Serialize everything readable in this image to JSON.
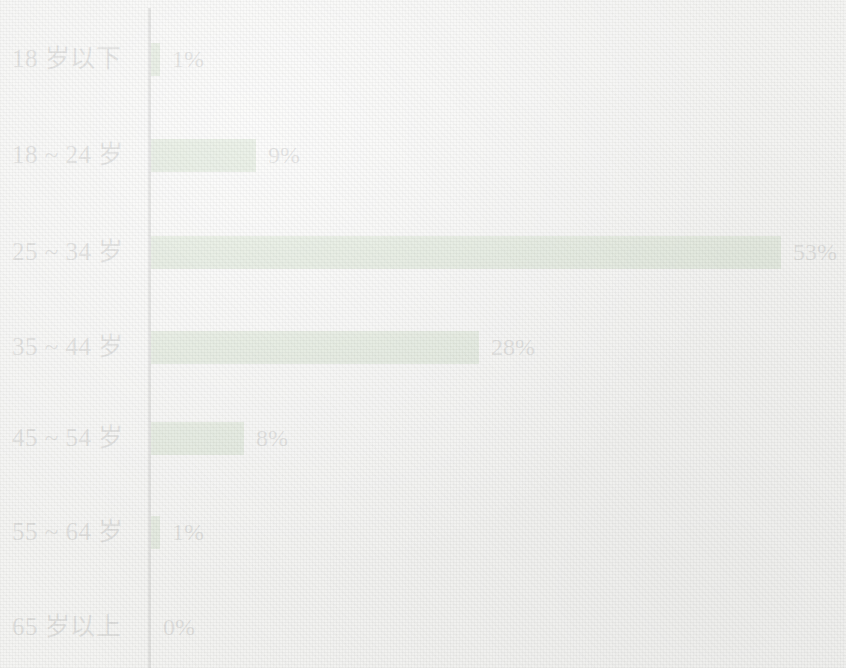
{
  "chart_data": {
    "type": "bar",
    "orientation": "horizontal",
    "title": "",
    "subtitle": "",
    "xlabel": "",
    "ylabel": "",
    "xlim": [
      0,
      53
    ],
    "ylim": null,
    "grid": false,
    "legend": null,
    "value_suffix": "%",
    "series_color": "#4e8a35",
    "axis_color": "#141414",
    "background_color": "#f3f3f1",
    "categories": [
      "18 岁以下",
      "18 ~ 24 岁",
      "25 ~ 34 岁",
      "35 ~ 44 岁",
      "45 ~ 54 岁",
      "55 ~ 64 岁",
      "65 岁以上"
    ],
    "values": [
      1,
      9,
      53,
      28,
      8,
      1,
      0
    ],
    "value_labels": [
      "1%",
      "9%",
      "53%",
      "28%",
      "8%",
      "1%",
      "0%"
    ],
    "bars": [
      {
        "category": "18 岁以下",
        "value": 1,
        "label": "1%",
        "bar_px": 9,
        "top_px": 42
      },
      {
        "category": "18 ~ 24 岁",
        "value": 9,
        "label": "9%",
        "bar_px": 105,
        "top_px": 138
      },
      {
        "category": "25 ~ 34 岁",
        "value": 53,
        "label": "53%",
        "bar_px": 630,
        "top_px": 235
      },
      {
        "category": "35 ~ 44 岁",
        "value": 28,
        "label": "28%",
        "bar_px": 328,
        "top_px": 330
      },
      {
        "category": "45 ~ 54 岁",
        "value": 8,
        "label": "8%",
        "bar_px": 93,
        "top_px": 421
      },
      {
        "category": "55 ~ 64 岁",
        "value": 1,
        "label": "1%",
        "bar_px": 9,
        "top_px": 515
      },
      {
        "category": "65 岁以上",
        "value": 0,
        "label": "0%",
        "bar_px": 0,
        "top_px": 610
      }
    ]
  }
}
